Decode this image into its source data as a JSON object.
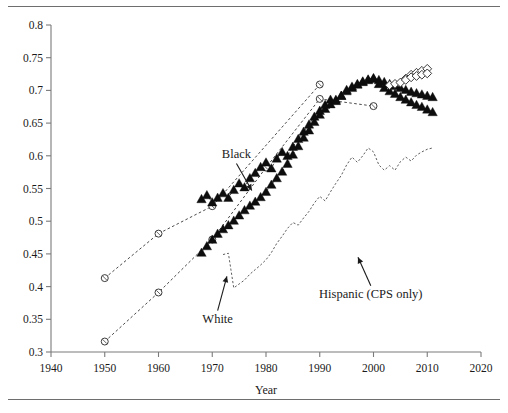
{
  "figure": {
    "title": "",
    "top_rule": true,
    "bottom_rule": true
  },
  "chart_data": {
    "type": "line",
    "title": "",
    "subtitle": "",
    "xlabel": "Year",
    "ylabel": "",
    "xlim": [
      1940,
      2020
    ],
    "ylim": [
      0.3,
      0.8
    ],
    "grid": false,
    "legend_position": "none",
    "xticks": [
      1940,
      1950,
      1960,
      1970,
      1980,
      1990,
      2000,
      2010,
      2020
    ],
    "xtick_labels": [
      "1940",
      "1950",
      "1960",
      "1970",
      "1980",
      "1990",
      "2000",
      "2010",
      "2020"
    ],
    "yticks": [
      0.3,
      0.35,
      0.4,
      0.45,
      0.5,
      0.55,
      0.6,
      0.65,
      0.7,
      0.75,
      0.8
    ],
    "ytick_labels": [
      "0.3",
      "0.35",
      "0.4",
      "0.45",
      "0.5",
      "0.55",
      "0.6",
      "0.65",
      "0.7",
      "0.75",
      "0.8"
    ],
    "annotations": [
      {
        "text": "Black",
        "x": 1974.5,
        "y": 0.596,
        "arrow_to_x": 1977.5,
        "arrow_to_y": 0.545
      },
      {
        "text": "White",
        "x": 1971.0,
        "y": 0.345,
        "arrow_to_x": 1972.8,
        "arrow_to_y": 0.418
      },
      {
        "text": "Hispanic (CPS only)",
        "x": 1999.5,
        "y": 0.383,
        "arrow_to_x": 1997.0,
        "arrow_to_y": 0.447
      }
    ],
    "series": [
      {
        "name": "White (Census decennial)",
        "marker": "open-circle",
        "line": "dashed",
        "x": [
          1950,
          1960,
          1970,
          1980,
          1990,
          2000
        ],
        "values": [
          0.316,
          0.391,
          0.472,
          0.582,
          0.687,
          0.676
        ]
      },
      {
        "name": "Black (Census decennial)",
        "marker": "open-circle",
        "line": "dashed",
        "x": [
          1950,
          1960,
          1970,
          1990
        ],
        "values": [
          0.413,
          0.481,
          0.523,
          0.709
        ]
      },
      {
        "name": "White (CPS annual)",
        "marker": "filled-triangle",
        "line": "dashed",
        "x": [
          1968,
          1969,
          1970,
          1971,
          1972,
          1973,
          1974,
          1975,
          1976,
          1977,
          1978,
          1979,
          1980,
          1981,
          1982,
          1983,
          1984,
          1985,
          1986,
          1987,
          1988,
          1989,
          1990,
          1991,
          1992,
          1993,
          1994,
          1995,
          1996,
          1997,
          1998,
          1999,
          2000,
          2001,
          2002,
          2003,
          2004,
          2005,
          2006,
          2007,
          2008,
          2009,
          2010,
          2011
        ],
        "values": [
          0.452,
          0.462,
          0.472,
          0.481,
          0.488,
          0.494,
          0.501,
          0.509,
          0.517,
          0.524,
          0.53,
          0.537,
          0.545,
          0.556,
          0.566,
          0.576,
          0.588,
          0.602,
          0.615,
          0.628,
          0.639,
          0.652,
          0.663,
          0.672,
          0.679,
          0.686,
          0.692,
          0.699,
          0.704,
          0.709,
          0.713,
          0.717,
          0.719,
          0.716,
          0.713,
          0.71,
          0.707,
          0.704,
          0.701,
          0.698,
          0.696,
          0.694,
          0.692,
          0.69
        ]
      },
      {
        "name": "Black (CPS annual)",
        "marker": "filled-triangle",
        "line": "dashed",
        "x": [
          1968,
          1969,
          1970,
          1971,
          1972,
          1973,
          1974,
          1975,
          1976,
          1977,
          1978,
          1979,
          1980,
          1981,
          1982,
          1983,
          1984,
          1985,
          1986,
          1987,
          1988,
          1989,
          1990,
          1991,
          1992,
          1993,
          1994,
          1995,
          1996,
          1997,
          1998,
          1999,
          2000,
          2001,
          2002,
          2003,
          2004,
          2005,
          2006,
          2007,
          2008,
          2009,
          2010,
          2011
        ],
        "values": [
          0.534,
          0.54,
          0.529,
          0.536,
          0.543,
          0.536,
          0.548,
          0.558,
          0.552,
          0.566,
          0.574,
          0.583,
          0.59,
          0.581,
          0.596,
          0.606,
          0.6,
          0.614,
          0.626,
          0.637,
          0.648,
          0.66,
          0.669,
          0.678,
          0.686,
          0.684,
          0.692,
          0.701,
          0.706,
          0.71,
          0.714,
          0.716,
          0.718,
          0.71,
          0.704,
          0.699,
          0.695,
          0.69,
          0.686,
          0.682,
          0.678,
          0.675,
          0.671,
          0.667
        ]
      },
      {
        "name": "Hispanic (CPS only)",
        "marker": "none",
        "line": "dashed",
        "x": [
          1972,
          1973,
          1974,
          1975,
          1976,
          1977,
          1978,
          1979,
          1980,
          1981,
          1982,
          1983,
          1984,
          1985,
          1986,
          1987,
          1988,
          1989,
          1990,
          1991,
          1992,
          1993,
          1994,
          1995,
          1996,
          1997,
          1998,
          1999,
          2000,
          2001,
          2002,
          2003,
          2004,
          2005,
          2006,
          2007,
          2008,
          2009,
          2010,
          2011
        ],
        "values": [
          0.449,
          0.451,
          0.398,
          0.404,
          0.41,
          0.419,
          0.426,
          0.433,
          0.441,
          0.452,
          0.466,
          0.477,
          0.489,
          0.498,
          0.494,
          0.505,
          0.515,
          0.528,
          0.538,
          0.531,
          0.545,
          0.558,
          0.57,
          0.586,
          0.598,
          0.59,
          0.6,
          0.612,
          0.606,
          0.586,
          0.578,
          0.585,
          0.578,
          0.591,
          0.598,
          0.592,
          0.601,
          0.606,
          0.61,
          0.612
        ]
      },
      {
        "name": "White (ACS)",
        "marker": "open-diamond",
        "line": "dashed",
        "x": [
          2006,
          2007,
          2008,
          2009,
          2010
        ],
        "values": [
          0.718,
          0.724,
          0.727,
          0.73,
          0.733
        ]
      },
      {
        "name": "Black (ACS)",
        "marker": "open-diamond",
        "line": "dashed",
        "x": [
          2003,
          2004,
          2005,
          2006,
          2007,
          2008,
          2009,
          2010
        ],
        "values": [
          0.708,
          0.71,
          0.712,
          0.716,
          0.72,
          0.722,
          0.724,
          0.726
        ]
      }
    ]
  }
}
